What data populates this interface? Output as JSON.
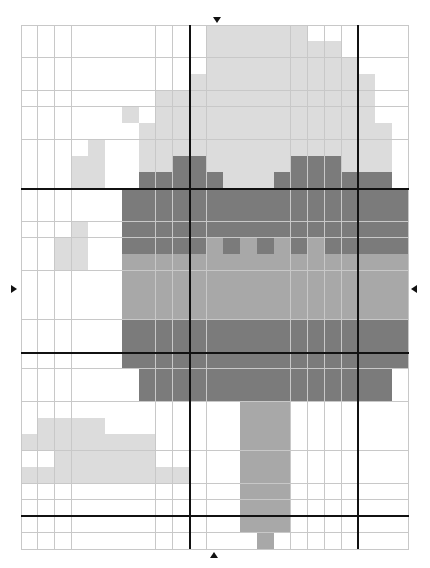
{
  "pattern": {
    "cols": 23,
    "rows": 32,
    "cell_width": 16.87,
    "cell_height": 16.375,
    "palette": {
      "0": "#ffffff",
      "1": "#dcdcdc",
      "2": "#a8a8a8",
      "3": "#7b7b7b"
    },
    "grid_line_color": "#c8c8c8",
    "major_line_color": "#111111",
    "major_every": 10,
    "major_cols": [
      10,
      20
    ],
    "major_rows": [
      10,
      20,
      30
    ],
    "center_markers": {
      "top": {
        "x": 217,
        "y": 20
      },
      "bottom": {
        "x": 214,
        "y": 555
      },
      "left": {
        "x": 14,
        "y": 289
      },
      "right": {
        "x": 414,
        "y": 289
      }
    },
    "cells": [
      "00000000000111111000000",
      "00000000000111111110000",
      "00000000000111111111000",
      "00000000001111111111100",
      "00000000111111111111100",
      "00000010111111111111100",
      "00000001111111111111110",
      "00001001111111111111110",
      "00011001133111113331110",
      "00011003333311133333330",
      "00000033333333333333333",
      "00000033333333333333333",
      "00010033333333333333333",
      "00110033333232323233333",
      "00110022222222222222222",
      "00000022222222222222222",
      "00000022222222222222222",
      "00000022222222222222222",
      "00000033333333333333333",
      "00000033333333333333333",
      "00000033333333333333333",
      "00000003333333333333330",
      "00000003333333333333330",
      "00000000000002220000000",
      "01111000000002220000000",
      "11111111000002220000000",
      "00111111000002220000000",
      "11111111110002220000000",
      "00000000000002220000000",
      "00000000000002220000000",
      "00000000000002220000000",
      "00000000000000200000000"
    ]
  }
}
